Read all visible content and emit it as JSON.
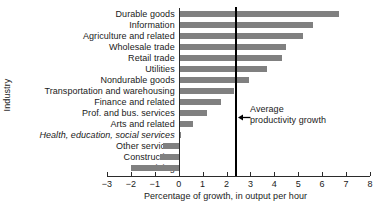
{
  "chart_data": {
    "type": "bar",
    "orientation": "horizontal",
    "title": "",
    "xlabel": "Percentage of growth, in output per hour",
    "ylabel": "Industry",
    "xlim": [
      -3,
      8
    ],
    "xticks": [
      -3,
      -2,
      -1,
      0,
      1,
      2,
      3,
      4,
      5,
      6,
      7,
      8
    ],
    "xtick_labels": [
      "−3",
      "−2",
      "−1",
      "0",
      "1",
      "2",
      "3",
      "4",
      "5",
      "6",
      "7",
      "8"
    ],
    "grid": false,
    "legend": null,
    "bar_color": "#808080",
    "categories": [
      "Durable goods",
      "Information",
      "Agriculture and related",
      "Wholesale trade",
      "Retail trade",
      "Utilities",
      "Nondurable goods",
      "Transportation and warehousing",
      "Finance and related",
      "Prof. and bus. services",
      "Arts and related",
      "Health, education, social services",
      "Other services",
      "Construction",
      "Mining"
    ],
    "values": [
      6.7,
      5.6,
      5.2,
      4.5,
      4.3,
      3.7,
      2.95,
      2.3,
      1.75,
      1.2,
      0.6,
      0.05,
      -0.65,
      -0.8,
      -2.0
    ],
    "italic_categories": [
      "Health, education, social services"
    ],
    "annotations": [
      {
        "type": "vline",
        "value": 2.38,
        "label_line1": "Average",
        "label_line2": "productivity growth",
        "color": "#000000"
      }
    ]
  },
  "axis": {
    "y_title": "Industry",
    "x_title": "Percentage of growth, in output per hour"
  },
  "annotation": {
    "line1": "Average",
    "line2": "productivity growth"
  }
}
